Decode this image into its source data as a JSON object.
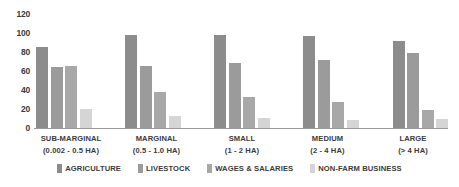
{
  "chart_data": {
    "type": "bar",
    "title": "",
    "subtitle": "",
    "xlabel": "",
    "ylabel": "",
    "ylim": [
      0,
      120
    ],
    "yticks": [
      "0",
      "20",
      "40",
      "60",
      "80",
      "100",
      "120"
    ],
    "grid": false,
    "legend_position": "bottom",
    "categories": [
      "SUB-MARGINAL",
      "MARGINAL",
      "SMALL",
      "MEDIUM",
      "LARGE"
    ],
    "category_ranges": [
      "(0.002 - 0.5 HA)",
      "(0.5 - 1.0 HA)",
      "(1 - 2 HA)",
      "(2 - 4 HA)",
      "(> 4 HA)"
    ],
    "series": [
      {
        "name": "AGRICULTURE",
        "color": "#8c8c8c",
        "values": [
          85,
          98,
          98,
          97,
          92
        ]
      },
      {
        "name": "LIVESTOCK",
        "color": "#9b9b9b",
        "values": [
          64,
          65,
          68,
          72,
          79
        ]
      },
      {
        "name": "WAGES & SALARIES",
        "color": "#a8a8a8",
        "values": [
          65,
          38,
          33,
          27,
          19
        ]
      },
      {
        "name": "NON-FARM BUSINESS",
        "color": "#d5d5d5",
        "values": [
          20,
          13,
          11,
          8,
          10
        ]
      }
    ]
  },
  "colors": {
    "background": "#ffffff",
    "text": "#3b3b3b",
    "axis": "#9a9a9a"
  }
}
